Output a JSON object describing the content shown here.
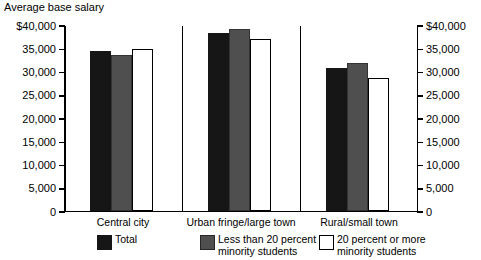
{
  "chart_data": {
    "type": "bar",
    "title": "Average base salary",
    "xlabel": "",
    "ylabel": "",
    "ylim": [
      0,
      40000
    ],
    "grid": false,
    "legend_position": "bottom",
    "dual_y_axis": true,
    "categories": [
      "Central city",
      "Urban fringe/large town",
      "Rural/small town"
    ],
    "y_ticks": [
      0,
      5000,
      10000,
      15000,
      20000,
      25000,
      30000,
      35000,
      40000
    ],
    "y_tick_labels_left": [
      "0",
      "5,000",
      "10,000",
      "15,000",
      "20,000",
      "25,000",
      "30,000",
      "35,000",
      "$40,000"
    ],
    "y_tick_labels_right": [
      "0",
      "5,000",
      "10,000",
      "15,000",
      "20,000",
      "25,000",
      "30,000",
      "35,000",
      "$40,000"
    ],
    "series": [
      {
        "name": "Total",
        "color": "#161616",
        "values": [
          34600,
          38600,
          31000
        ]
      },
      {
        "name": "Less than 20 percent\nminority students",
        "color": "#4f4f4f",
        "values": [
          33800,
          39400,
          32000
        ]
      },
      {
        "name": "20 percent or more\nminority students",
        "color": "#ffffff",
        "values": [
          35000,
          37200,
          28800
        ]
      }
    ]
  },
  "legend": {
    "items": [
      {
        "label": "Total",
        "swatch": "black-square-swatch"
      },
      {
        "label": "Less than 20 percent\nminority students",
        "swatch": "gray-square-swatch"
      },
      {
        "label": "20 percent or more\nminority students",
        "swatch": "white-square-swatch"
      }
    ]
  }
}
